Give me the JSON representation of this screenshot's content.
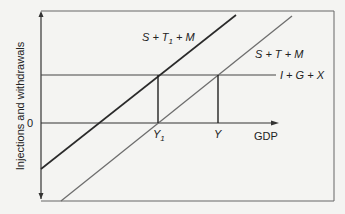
{
  "diagram": {
    "y_axis_label": "Injections and withdrawals",
    "x_axis_label": "GDP",
    "origin_label": "0",
    "lines": {
      "dark_withdrawals": "S + T₁ + M",
      "dark_withdrawals_base": "S + T",
      "dark_withdrawals_sub": "1",
      "dark_withdrawals_tail": " + M",
      "grey_withdrawals": "S + T + M",
      "injections": "I + G + X"
    },
    "x_markers": {
      "y1_base": "Y",
      "y1_sub": "1",
      "y": "Y"
    },
    "colors": {
      "background": "#f4f4f2",
      "frame": "#555555",
      "dark_line": "#2a2a2a",
      "grey_line": "#707070",
      "axis": "#333333"
    }
  }
}
